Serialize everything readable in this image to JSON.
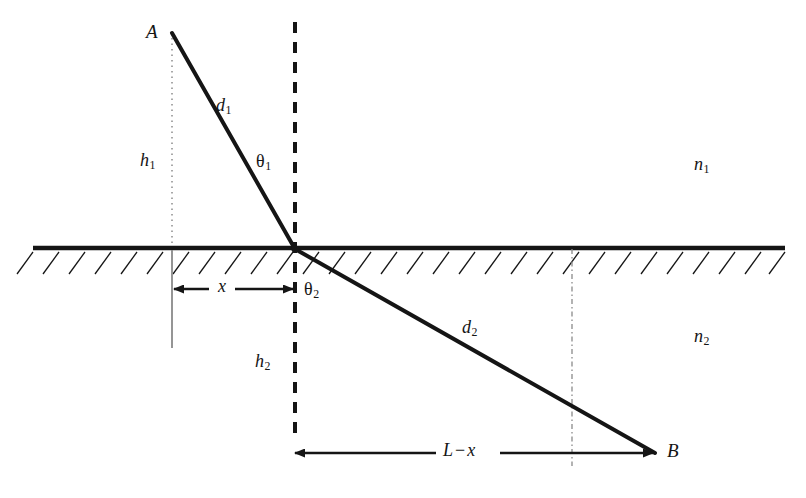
{
  "figure": {
    "type": "optics-ray-diagram",
    "width": 806,
    "height": 498,
    "background_color": "#ffffff",
    "stroke_color": "#151515",
    "label_color": "#151515"
  },
  "labels": {
    "point_a": "A",
    "point_b": "B",
    "distance_1": "d",
    "distance_1_sub": "1",
    "distance_2": "d",
    "distance_2_sub": "2",
    "height_1": "h",
    "height_1_sub": "1",
    "height_2": "h",
    "height_2_sub": "2",
    "angle_1": "θ",
    "angle_1_sub": "1",
    "angle_2": "θ",
    "angle_2_sub": "2",
    "index_1": "n",
    "index_1_sub": "1",
    "index_2": "n",
    "index_2_sub": "2",
    "dim_x": "x",
    "dim_l_minus_x_first": "L",
    "dim_l_minus_x_op": "−",
    "dim_l_minus_x_second": "x"
  },
  "geometry": {
    "interface_y": 248,
    "interface_x_start": 33,
    "interface_x_end": 785,
    "point_a": {
      "x": 172,
      "y": 33
    },
    "refraction_point": {
      "x": 295,
      "y": 249
    },
    "point_b": {
      "x": 655,
      "y": 453
    },
    "normal_line_x": 295,
    "normal_top_y": 22,
    "normal_bottom_y": 438,
    "left_vertical_x": 172,
    "left_vertical_top_y": 38,
    "left_vertical_solid_bottom_y": 348,
    "right_vertical_x": 572,
    "right_vertical_bottom_y": 466,
    "dim_x_y": 289,
    "dim_x_from": 172,
    "dim_x_to": 295,
    "dim_lx_y": 453,
    "dim_lx_from": 293,
    "dim_lx_to": 655,
    "hatch_length": 22,
    "hatch_spacing": 26
  },
  "label_positions": {
    "point_a": {
      "x": 146,
      "y": 22
    },
    "point_b": {
      "x": 667,
      "y": 441
    },
    "distance_1": {
      "x": 216,
      "y": 96
    },
    "distance_2": {
      "x": 462,
      "y": 318
    },
    "height_1": {
      "x": 140,
      "y": 151
    },
    "height_2": {
      "x": 255,
      "y": 352
    },
    "angle_1": {
      "x": 256,
      "y": 152
    },
    "angle_2": {
      "x": 304,
      "y": 280
    },
    "index_1": {
      "x": 694,
      "y": 155
    },
    "index_2": {
      "x": 694,
      "y": 327
    },
    "dim_x": {
      "x": 218,
      "y": 277
    },
    "dim_lx": {
      "x": 443,
      "y": 441
    }
  }
}
